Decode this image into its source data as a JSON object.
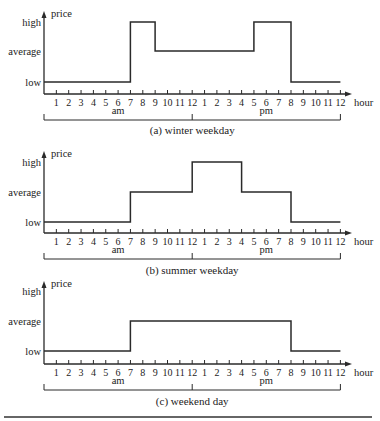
{
  "layout": {
    "x0": 44,
    "xEnd": 352,
    "hourStart": 44,
    "pxPerHour": 12.35,
    "panels": [
      {
        "yHigh": 22,
        "yAvg": 51,
        "yLow": 82,
        "yAxis": 94,
        "yTop": 12,
        "yTickLbl": 106,
        "yAmPm": 114,
        "yBracket": 120,
        "yCap": 134
      },
      {
        "yHigh": 162,
        "yAvg": 192,
        "yLow": 222,
        "yAxis": 233,
        "yTop": 152,
        "yTickLbl": 245,
        "yAmPm": 253,
        "yBracket": 259,
        "yCap": 274
      },
      {
        "yHigh": 291,
        "yAvg": 321,
        "yLow": 351,
        "yAxis": 364,
        "yTop": 282,
        "yTickLbl": 376,
        "yAmPm": 384,
        "yBracket": 390,
        "yCap": 405
      }
    ],
    "bottomRuleY": 417
  },
  "chart_data": [
    {
      "type": "line",
      "step": true,
      "title": "(a) winter weekday",
      "ylabel": "price",
      "xlabel": "hour",
      "y_levels": [
        "low",
        "average",
        "high"
      ],
      "x_tick_labels": [
        "1",
        "2",
        "3",
        "4",
        "5",
        "6",
        "7",
        "8",
        "9",
        "10",
        "11",
        "12",
        "1",
        "2",
        "3",
        "4",
        "5",
        "6",
        "7",
        "8",
        "9",
        "10",
        "11",
        "12"
      ],
      "periods": [
        "am",
        "pm"
      ],
      "segments": [
        {
          "from": 0,
          "to": 7,
          "level": "low"
        },
        {
          "from": 7,
          "to": 9,
          "level": "high"
        },
        {
          "from": 9,
          "to": 17,
          "level": "average"
        },
        {
          "from": 17,
          "to": 20,
          "level": "high"
        },
        {
          "from": 20,
          "to": 24,
          "level": "low"
        }
      ],
      "x": [
        0,
        7,
        7,
        9,
        9,
        17,
        17,
        20,
        20,
        24
      ],
      "y": [
        "low",
        "low",
        "high",
        "high",
        "average",
        "average",
        "high",
        "high",
        "low",
        "low"
      ]
    },
    {
      "type": "line",
      "step": true,
      "title": "(b) summer weekday",
      "ylabel": "price",
      "xlabel": "hour",
      "y_levels": [
        "low",
        "average",
        "high"
      ],
      "x_tick_labels": [
        "1",
        "2",
        "3",
        "4",
        "5",
        "6",
        "7",
        "8",
        "9",
        "10",
        "11",
        "12",
        "1",
        "2",
        "3",
        "4",
        "5",
        "6",
        "7",
        "8",
        "9",
        "10",
        "11",
        "12"
      ],
      "periods": [
        "am",
        "pm"
      ],
      "segments": [
        {
          "from": 0,
          "to": 7,
          "level": "low"
        },
        {
          "from": 7,
          "to": 12,
          "level": "average"
        },
        {
          "from": 12,
          "to": 16,
          "level": "high"
        },
        {
          "from": 16,
          "to": 20,
          "level": "average"
        },
        {
          "from": 20,
          "to": 24,
          "level": "low"
        }
      ],
      "x": [
        0,
        7,
        7,
        12,
        12,
        16,
        16,
        20,
        20,
        24
      ],
      "y": [
        "low",
        "low",
        "average",
        "average",
        "high",
        "high",
        "average",
        "average",
        "low",
        "low"
      ]
    },
    {
      "type": "line",
      "step": true,
      "title": "(c) weekend day",
      "ylabel": "price",
      "xlabel": "hour",
      "y_levels": [
        "low",
        "average",
        "high"
      ],
      "x_tick_labels": [
        "1",
        "2",
        "3",
        "4",
        "5",
        "6",
        "7",
        "8",
        "9",
        "10",
        "11",
        "12",
        "1",
        "2",
        "3",
        "4",
        "5",
        "6",
        "7",
        "8",
        "9",
        "10",
        "11",
        "12"
      ],
      "periods": [
        "am",
        "pm"
      ],
      "segments": [
        {
          "from": 0,
          "to": 7,
          "level": "low"
        },
        {
          "from": 7,
          "to": 20,
          "level": "average"
        },
        {
          "from": 20,
          "to": 24,
          "level": "low"
        }
      ],
      "x": [
        0,
        7,
        7,
        20,
        20,
        24
      ],
      "y": [
        "low",
        "low",
        "average",
        "average",
        "low",
        "low"
      ]
    }
  ],
  "labels": {
    "price": "price",
    "hour": "hour",
    "high": "high",
    "average": "average",
    "low": "low",
    "am": "am",
    "pm": "pm"
  },
  "colors": {
    "line": "#2a2a2a",
    "text": "#222222",
    "background": "#ffffff"
  }
}
